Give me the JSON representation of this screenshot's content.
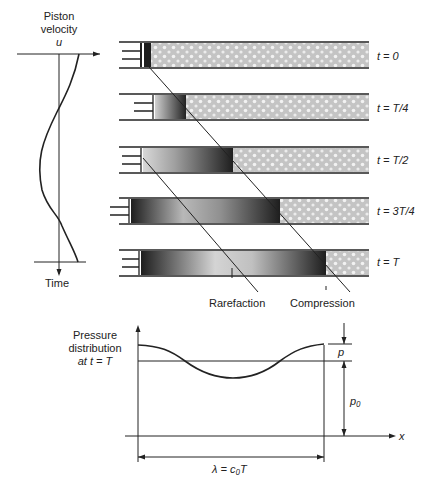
{
  "velocity_plot": {
    "title_line1": "Piston",
    "title_line2": "velocity",
    "axis_symbol": "u",
    "time_label": "Time"
  },
  "tubes": [
    {
      "label": "t = 0"
    },
    {
      "label": "t = T/4"
    },
    {
      "label": "t = T/2"
    },
    {
      "label": "t = 3T/4"
    },
    {
      "label": "t = T"
    }
  ],
  "wave_labels": {
    "rarefaction": "Rarefaction",
    "compression": "Compression"
  },
  "pressure_plot": {
    "title_line1": "Pressure",
    "title_line2": "distribution",
    "title_line3": "at  t = T",
    "amplitude_symbol": "p",
    "ambient_symbol": "p₀",
    "x_axis_symbol": "x",
    "wavelength_label": "λ  = c₀T"
  },
  "colors": {
    "line": "#222222",
    "tube_fill": "#c8c8c8",
    "dark_fill": "#2a2a2a"
  }
}
